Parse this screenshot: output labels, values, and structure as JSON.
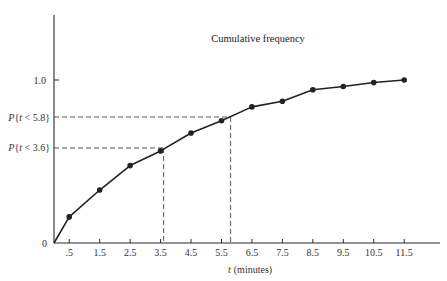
{
  "chart_data": {
    "type": "line",
    "title": "Cumulative frequency",
    "xlabel": "t (minutes)",
    "xlabel_var": "t",
    "xlabel_unit": "(minutes)",
    "ylabel": "",
    "origin_label": "0",
    "x": [
      0.5,
      1.5,
      2.5,
      3.5,
      4.5,
      5.5,
      6.5,
      7.5,
      8.5,
      9.5,
      10.5,
      11.5
    ],
    "x_tick_labels": [
      ".5",
      "1.5",
      "2.5",
      "3.5",
      "4.5",
      "5.5",
      "6.5",
      "7.5",
      "8.5",
      "9.5",
      "10.5",
      "11.5"
    ],
    "series": [
      {
        "name": "Cumulative frequency",
        "start": [
          0,
          0
        ],
        "values": [
          0.16,
          0.325,
          0.475,
          0.565,
          0.675,
          0.75,
          0.835,
          0.87,
          0.94,
          0.96,
          0.985,
          1.0
        ],
        "marker": "circle",
        "color": "#222222"
      }
    ],
    "y_ticks": [
      {
        "value": 1.0,
        "label": "1.0"
      }
    ],
    "annotations": [
      {
        "label": "P{t < 5.8}",
        "x": 5.8,
        "y": 0.773,
        "style": "dashed"
      },
      {
        "label": "P{t < 3.6}",
        "x": 3.6,
        "y": 0.583,
        "style": "dashed"
      }
    ],
    "xlim": [
      0,
      12.6
    ],
    "ylim": [
      0,
      1.4
    ],
    "grid": false,
    "legend": "none"
  }
}
